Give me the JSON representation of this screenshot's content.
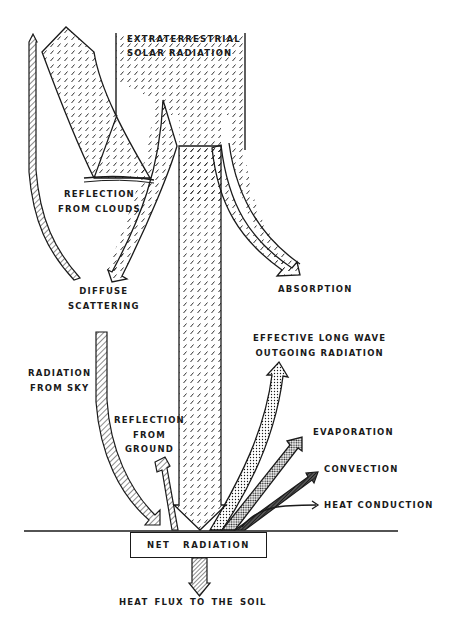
{
  "diagram": {
    "colors": {
      "ink": "#1a1a1a",
      "background": "#ffffff"
    },
    "labels": {
      "extraterrestrial": [
        "EXTRATERRESTRIAL",
        "SOLAR  RADIATION"
      ],
      "reflection_clouds": [
        "REFLECTION",
        "FROM   CLOUDS"
      ],
      "diffuse_scattering": [
        "DIFFUSE",
        "SCATTERING"
      ],
      "absorption": [
        "ABSORPTION"
      ],
      "radiation_sky": [
        "RADIATION",
        "FROM   SKY"
      ],
      "reflection_ground": [
        "REFLECTION",
        "FROM",
        "GROUND"
      ],
      "longwave": [
        "EFFECTIVE   LONG   WAVE",
        "OUTGOING   RADIATION"
      ],
      "evaporation": [
        "EVAPORATION"
      ],
      "convection": [
        "CONVECTION"
      ],
      "heat_conduction": [
        "HEAT   CONDUCTION"
      ],
      "net_radiation": "NET  RADIATION",
      "heat_flux_soil": "HEAT   FLUX   TO   THE   SOIL"
    },
    "fill_patterns": {
      "solar": "dashed-hatch",
      "longwave": "light-dots",
      "evaporation": "dense-dots",
      "convection": "dark-hatch",
      "soil_flux": "diagonal-lines"
    }
  }
}
